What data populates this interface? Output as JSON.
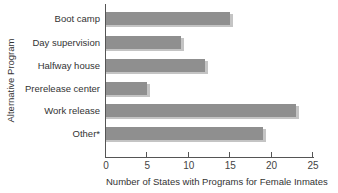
{
  "chart_data": {
    "type": "bar",
    "orientation": "horizontal",
    "title": "",
    "xlabel": "Number of States with Programs for Female Inmates",
    "ylabel": "Alternative Program",
    "categories": [
      "Boot camp",
      "Day supervision",
      "Halfway house",
      "Prerelease center",
      "Work release",
      "Other*"
    ],
    "values": [
      15,
      9,
      12,
      5,
      23,
      19
    ],
    "xlim": [
      0,
      25
    ],
    "xticks": [
      0,
      5,
      10,
      15,
      20,
      25
    ],
    "grid": false,
    "legend": null,
    "bar_color": "#8f8f8f",
    "shadow_color": "#c4c4c4"
  },
  "axis": {
    "ylabel": "Alternative Program",
    "xlabel": "Number of States with Programs for Female Inmates",
    "ticks": [
      "0",
      "5",
      "10",
      "15",
      "20",
      "25"
    ]
  },
  "rows": [
    {
      "label": "Boot camp",
      "value": 15
    },
    {
      "label": "Day supervision",
      "value": 9
    },
    {
      "label": "Halfway house",
      "value": 12
    },
    {
      "label": "Prerelease center",
      "value": 5
    },
    {
      "label": "Work release",
      "value": 23
    },
    {
      "label": "Other*",
      "value": 19
    }
  ]
}
